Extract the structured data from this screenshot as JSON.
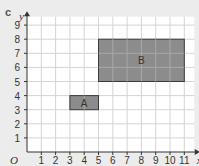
{
  "part_label": "c",
  "axes": {
    "x_label": "x",
    "y_label": "y",
    "origin_label": "O",
    "x_ticks": [
      "1",
      "2",
      "3",
      "4",
      "5",
      "6",
      "7",
      "8",
      "9",
      "10",
      "11"
    ],
    "y_ticks": [
      "1",
      "2",
      "3",
      "4",
      "5",
      "6",
      "7",
      "8",
      "9"
    ]
  },
  "shapes": [
    {
      "label": "A",
      "x1": 3,
      "y1": 3,
      "x2": 5,
      "y2": 4
    },
    {
      "label": "B",
      "x1": 5,
      "y1": 5,
      "x2": 11,
      "y2": 8
    }
  ],
  "colors": {
    "background": "#ececec",
    "grid_bg": "#ffffff",
    "grid_line": "#d4d4d4",
    "shape_fill": "#8c8c8c",
    "shape_stroke": "#3a3a3a"
  }
}
